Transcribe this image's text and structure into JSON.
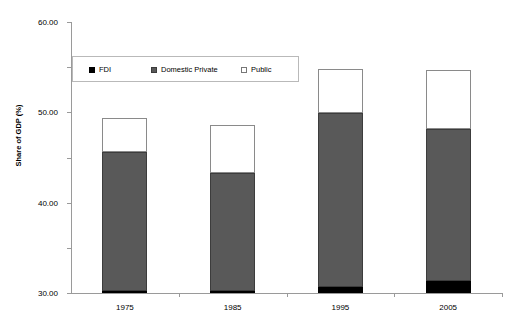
{
  "chart_data": {
    "type": "bar",
    "stacked": true,
    "title": "",
    "xlabel": "",
    "ylabel": "Share of GDP (%)",
    "categories": [
      "1975",
      "1985",
      "1995",
      "2005"
    ],
    "series": [
      {
        "name": "FDI",
        "color": "#000000",
        "values": [
          0.4,
          0.4,
          1.3,
          2.6
        ]
      },
      {
        "name": "Domestic Private",
        "color": "#595959",
        "values": [
          30.8,
          26.2,
          38.5,
          33.7
        ]
      },
      {
        "name": "Public",
        "color": "#ffffff",
        "values": [
          7.6,
          10.5,
          9.8,
          13.0
        ]
      }
    ],
    "totals": [
      38.8,
      37.1,
      49.6,
      49.3
    ],
    "ylim": [
      0,
      60
    ],
    "yticks": [
      0,
      10,
      20,
      30,
      40,
      50,
      60
    ],
    "ytick_labels": [
      "0.00",
      "10.00",
      "20.00",
      "30.00",
      "40.00",
      "50.00",
      "60.00"
    ],
    "grid": false,
    "legend_position": "upper-left-inside"
  },
  "legend": {
    "items": [
      {
        "label": "FDI",
        "swatch": "legend-swatch-fdi"
      },
      {
        "label": "Domestic Private",
        "swatch": "legend-swatch-domestic-private"
      },
      {
        "label": "Public",
        "swatch": "legend-swatch-public"
      }
    ]
  }
}
